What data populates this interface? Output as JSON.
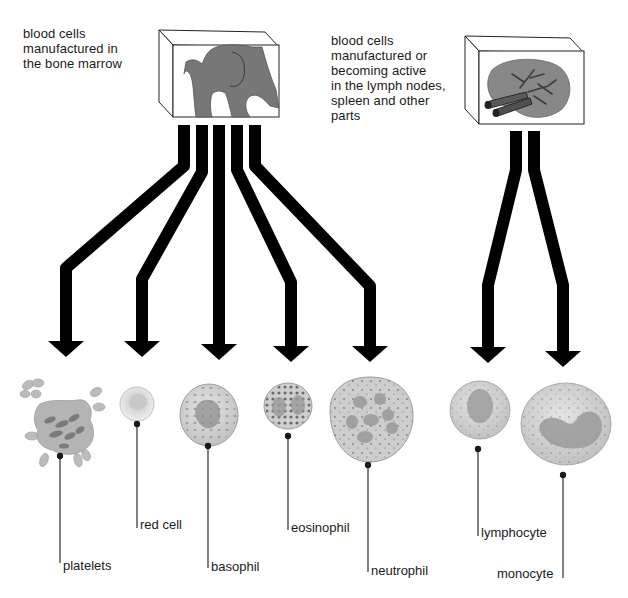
{
  "captions": {
    "marrow": "blood cells\nmanufactured in\nthe bone marrow",
    "lymph": "blood cells\nmanufactured or\nbecoming active\nin the lymph nodes,\nspleen and other\nparts"
  },
  "sources": [
    {
      "id": "bone-marrow",
      "depicts": "hip bone (femur head and pelvis) in box"
    },
    {
      "id": "lymph-spleen",
      "depicts": "spleen with blood vessels in box"
    }
  ],
  "cells": [
    {
      "name": "platelets",
      "label": "platelets",
      "source": "bone-marrow"
    },
    {
      "name": "red-cell",
      "label": "red cell",
      "source": "bone-marrow"
    },
    {
      "name": "basophil",
      "label": "basophil",
      "source": "bone-marrow"
    },
    {
      "name": "eosinophil",
      "label": "eosinophil",
      "source": "bone-marrow"
    },
    {
      "name": "neutrophil",
      "label": "neutrophil",
      "source": "bone-marrow"
    },
    {
      "name": "lymphocyte",
      "label": "lymphocyte",
      "source": "lymph-spleen"
    },
    {
      "name": "monocyte",
      "label": "monocyte",
      "source": "lymph-spleen"
    }
  ],
  "colors": {
    "arrow": "#000000",
    "tissue": "#7a7a7a",
    "cell_fill": "#d4d4d4",
    "cell_stroke": "#8a8a8a",
    "nucleus": "#9a9a9a"
  }
}
